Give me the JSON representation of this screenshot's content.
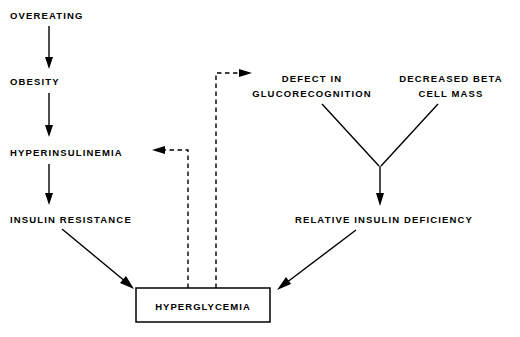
{
  "diagram": {
    "background_color": "#ffffff",
    "line_color": "#000000",
    "nodes": {
      "overeating": {
        "label": "OVEREATING",
        "x": 10,
        "y": 19
      },
      "obesity": {
        "label": "OBESITY",
        "x": 10,
        "y": 85
      },
      "hyperinsulinemia": {
        "label": "HYPERINSULINEMIA",
        "x": 10,
        "y": 156
      },
      "insulin_resistance": {
        "label": "INSULIN  RESISTANCE",
        "x": 10,
        "y": 223
      },
      "defect_line1": {
        "label": "DEFECT  IN",
        "x": 312,
        "y": 82
      },
      "defect_line2": {
        "label": "GLUCORECOGNITION",
        "x": 312,
        "y": 97
      },
      "beta_line1": {
        "label": "DECREASED  BETA",
        "x": 451,
        "y": 82
      },
      "beta_line2": {
        "label": "CELL  MASS",
        "x": 451,
        "y": 97
      },
      "relative_insulin_deficiency": {
        "label": "RELATIVE  INSULIN  DEFICIENCY",
        "x": 384,
        "y": 223
      },
      "hyperglycemia": {
        "label": "HYPERGLYCEMIA",
        "x": 203,
        "y": 310
      }
    },
    "box": {
      "name": "hyperglycemia-box",
      "x": 136,
      "y": 288,
      "width": 134,
      "height": 34
    },
    "connectors": [
      {
        "name": "overeating-to-obesity",
        "style": "solid",
        "from": "OVEREATING",
        "to": "OBESITY"
      },
      {
        "name": "obesity-to-hyperinsulinemia",
        "style": "solid",
        "from": "OBESITY",
        "to": "HYPERINSULINEMIA"
      },
      {
        "name": "hyperinsulinemia-to-insulin-resistance",
        "style": "solid",
        "from": "HYPERINSULINEMIA",
        "to": "INSULIN  RESISTANCE"
      },
      {
        "name": "insulin-resistance-to-hyperglycemia",
        "style": "solid",
        "from": "INSULIN  RESISTANCE",
        "to": "HYPERGLYCEMIA"
      },
      {
        "name": "defect-to-junction",
        "style": "solid",
        "from": "DEFECT  IN GLUCORECOGNITION",
        "to": "junction"
      },
      {
        "name": "beta-cell-mass-to-junction",
        "style": "solid",
        "from": "DECREASED  BETA CELL MASS",
        "to": "junction"
      },
      {
        "name": "junction-to-relative-insulin-deficiency",
        "style": "solid",
        "from": "junction",
        "to": "RELATIVE  INSULIN  DEFICIENCY"
      },
      {
        "name": "relative-insulin-deficiency-to-hyperglycemia",
        "style": "solid",
        "from": "RELATIVE  INSULIN  DEFICIENCY",
        "to": "HYPERGLYCEMIA"
      },
      {
        "name": "hyperglycemia-feedback-to-hyperinsulinemia",
        "style": "dashed",
        "from": "HYPERGLYCEMIA",
        "to": "HYPERINSULINEMIA"
      },
      {
        "name": "hyperglycemia-feedback-to-defect",
        "style": "dashed",
        "from": "HYPERGLYCEMIA",
        "to": "DEFECT  IN GLUCORECOGNITION"
      }
    ]
  }
}
